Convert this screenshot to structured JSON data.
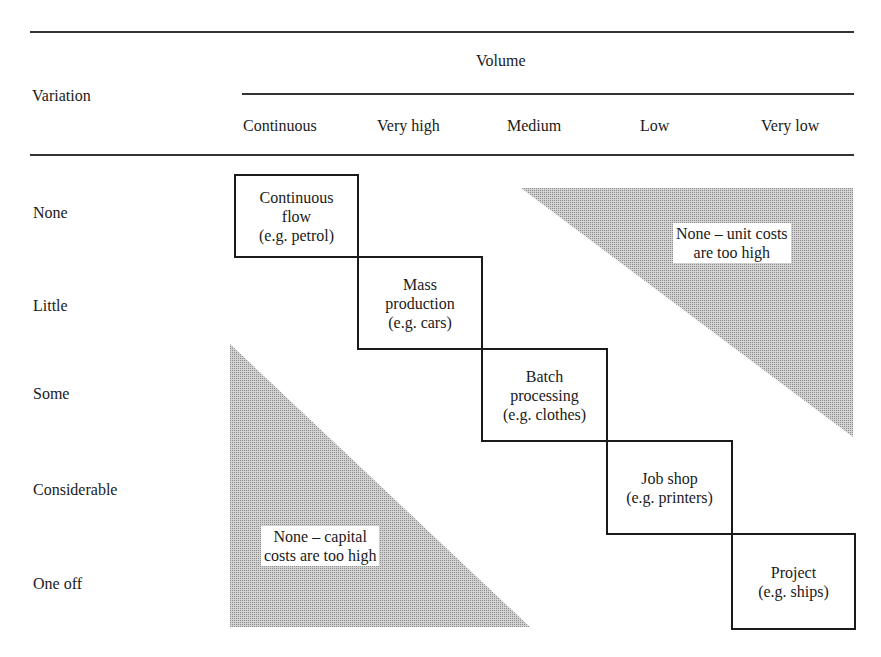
{
  "table": {
    "row_header": "Variation",
    "column_group_header": "Volume",
    "columns": [
      "Continuous",
      "Very high",
      "Medium",
      "Low",
      "Very low"
    ],
    "rows": [
      "None",
      "Little",
      "Some",
      "Considerable",
      "One off"
    ]
  },
  "cells": [
    {
      "lines": [
        "Continuous",
        "flow",
        "(e.g. petrol)"
      ],
      "row": "None",
      "column": "Continuous"
    },
    {
      "lines": [
        "Mass",
        "production",
        "(e.g. cars)"
      ],
      "row": "Little",
      "column": "Very high"
    },
    {
      "lines": [
        "Batch",
        "processing",
        "(e.g. clothes)"
      ],
      "row": "Some",
      "column": "Medium"
    },
    {
      "lines": [
        "Job shop",
        "(e.g. printers)"
      ],
      "row": "Considerable",
      "column": "Low"
    },
    {
      "lines": [
        "Project",
        "(e.g. ships)"
      ],
      "row": "One off",
      "column": "Very low"
    }
  ],
  "regions": {
    "upper_right": {
      "lines": [
        "None – unit costs",
        "are too high"
      ]
    },
    "lower_left": {
      "lines": [
        "None – capital",
        "costs are too high"
      ]
    }
  },
  "colors": {
    "line": "#1a1a1a",
    "shade": "#c8c8c8",
    "shade_dot": "#8a8a8a"
  }
}
